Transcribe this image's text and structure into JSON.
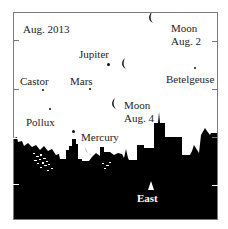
{
  "diagram": {
    "title": "Aug. 2013",
    "direction_label": "East",
    "colors": {
      "frame": "#7a7a7a",
      "sky": "#ffffff",
      "skyline": "#000000",
      "text": "#222222"
    },
    "objects": [
      {
        "name": "Jupiter",
        "type": "planet"
      },
      {
        "name": "Mars",
        "type": "planet"
      },
      {
        "name": "Mercury",
        "type": "planet"
      },
      {
        "name": "Castor",
        "type": "star"
      },
      {
        "name": "Pollux",
        "type": "star"
      },
      {
        "name": "Betelgeuse",
        "type": "star"
      }
    ],
    "moons": [
      {
        "line1": "Moon",
        "line2": "Aug. 2"
      },
      {
        "line1": "Moon",
        "line2": "Aug. 4"
      }
    ]
  }
}
